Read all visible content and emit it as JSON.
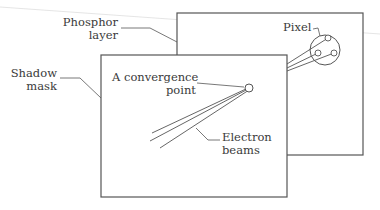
{
  "figure": {
    "type": "diagram",
    "labels": {
      "phosphor_layer": {
        "line1": "Phosphor",
        "line2": "layer"
      },
      "shadow_mask": {
        "line1": "Shadow",
        "line2": "mask"
      },
      "convergence_point": {
        "line1": "A convergence",
        "line2": "point"
      },
      "electron_beams": {
        "line1": "Electron",
        "line2": "beams"
      },
      "pixel": {
        "line1": "Pixel"
      }
    },
    "colors": {
      "stroke": "#555555",
      "text": "#3a3a3a",
      "background": "#ffffff",
      "artifact_line": "#dddddd"
    },
    "components": {
      "phosphor_layer_rect": {
        "x": 177,
        "y": 13,
        "w": 186,
        "h": 142
      },
      "shadow_mask_rect": {
        "x": 101,
        "y": 55,
        "w": 186,
        "h": 142
      },
      "pixel_circle": {
        "cx": 325,
        "cy": 50,
        "r": 15
      },
      "phosphor_dots": [
        {
          "cx": 328,
          "cy": 38,
          "r": 3
        },
        {
          "cx": 318,
          "cy": 53,
          "r": 3
        },
        {
          "cx": 334,
          "cy": 53,
          "r": 3
        }
      ],
      "convergence_circle": {
        "cx": 249,
        "cy": 88,
        "r": 4
      }
    }
  }
}
